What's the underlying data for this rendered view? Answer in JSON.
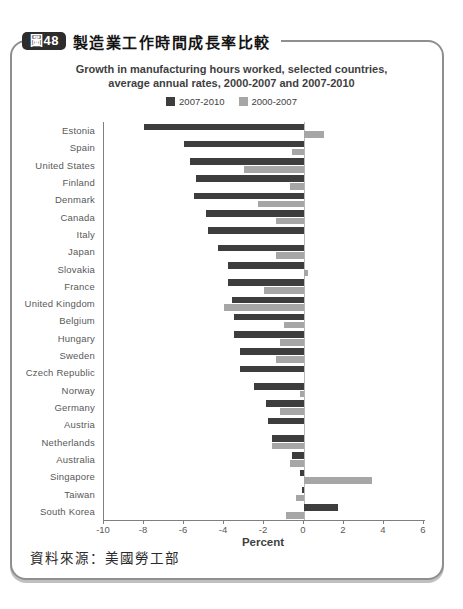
{
  "header": {
    "badge": "圖48",
    "title": "製造業工作時間成長率比較"
  },
  "source_note": "資料來源：美國勞工部",
  "colors": {
    "badge_bg": "#2d2d2d",
    "card_border": "#8f8f8f",
    "series_dark": "#3d3d3d",
    "series_gray": "#a6a6a6",
    "axis_line": "#7f7f7f",
    "zero_line": "#b8b8b8",
    "label_text": "#595959"
  },
  "chart_data": {
    "type": "bar",
    "orientation": "horizontal",
    "title_line1": "Growth in manufacturing hours worked, selected countries,",
    "title_line2": "average annual rates, 2000-2007 and 2007-2010",
    "xlabel": "Percent",
    "xlim": [
      -10,
      6
    ],
    "xticks": [
      -10,
      -8,
      -6,
      -4,
      -2,
      0,
      2,
      4,
      6
    ],
    "grid": "zero-line-only",
    "legend_position": "top-center",
    "categories": [
      "Estonia",
      "Spain",
      "United States",
      "Finland",
      "Denmark",
      "Canada",
      "Italy",
      "Japan",
      "Slovakia",
      "France",
      "United Kingdom",
      "Belgium",
      "Hungary",
      "Sweden",
      "Czech Republic",
      "Norway",
      "Germany",
      "Austria",
      "Netherlands",
      "Australia",
      "Singapore",
      "Taiwan",
      "South Korea"
    ],
    "series": [
      {
        "name": "2007-2010",
        "color": "#3d3d3d",
        "values": [
          -8.0,
          -6.0,
          -5.7,
          -5.4,
          -5.5,
          -4.9,
          -4.8,
          -4.3,
          -3.8,
          -3.8,
          -3.6,
          -3.5,
          -3.5,
          -3.2,
          -3.2,
          -2.5,
          -1.9,
          -1.8,
          -1.6,
          -0.6,
          -0.2,
          -0.1,
          1.7
        ]
      },
      {
        "name": "2000-2007",
        "color": "#a6a6a6",
        "values": [
          1.0,
          -0.6,
          -3.0,
          -0.7,
          -2.3,
          -1.4,
          0.0,
          -1.4,
          0.2,
          -2.0,
          -4.0,
          -1.0,
          -1.2,
          -1.4,
          0.0,
          -0.2,
          -1.2,
          0.0,
          -1.6,
          -0.7,
          3.4,
          -0.4,
          -0.9
        ]
      }
    ]
  }
}
